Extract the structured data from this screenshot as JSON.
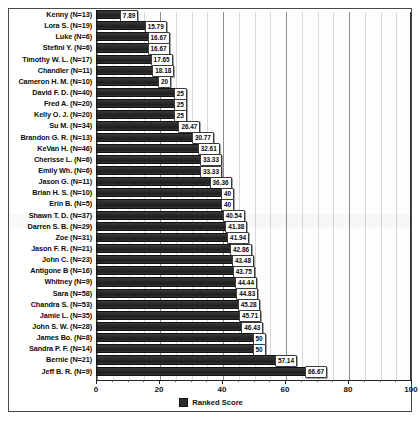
{
  "chart_data": {
    "type": "bar",
    "orientation": "horizontal",
    "title": "",
    "xlabel": "",
    "ylabel": "",
    "xlim": [
      0,
      100
    ],
    "xticks": [
      0,
      20,
      40,
      60,
      80,
      100
    ],
    "minor_tick_step": 5,
    "grid": true,
    "legend_position": "bottom",
    "legend": [
      "Ranked Score"
    ],
    "series_name": "Ranked Score",
    "bar_color": "#2b2b2b",
    "categories": [
      "Kenny (N=13)",
      "Lora S. (N=19)",
      "Luke (N=6)",
      "Stefini Y. (N=6)",
      "Timothy W. L. (N=17)",
      "Chandler (N=11)",
      "Cameron H. M. (N=10)",
      "David F. D. (N=40)",
      "Fred A. (N=20)",
      "Kelly O. J. (N=20)",
      "Su M. (N=34)",
      "Brandon G. R. (N=13)",
      "KeVan H. (N=46)",
      "Cherisse L. (N=6)",
      "Emily Wh. (N=6)",
      "Jason G. (N=11)",
      "Brian H. S. (N=10)",
      "Erin B. (N=5)",
      "Shawn T. D. (N=37)",
      "Darren S. B. (N=29)",
      "Zoe (N=31)",
      "Jason F. R. (N=21)",
      "John C. (N=23)",
      "Antigone B (N=16)",
      "Whitney (N=9)",
      "Sara (N=58)",
      "Chandra S. (N=53)",
      "Jamie L. (N=35)",
      "John S. W. (N=28)",
      "James Bo. (N=8)",
      "Sandra P. F. (N=14)",
      "Bernie (N=21)",
      "Jeff B. R. (N=9)"
    ],
    "values": [
      7.89,
      15.79,
      16.67,
      16.67,
      17.65,
      18.18,
      20,
      25,
      25,
      25,
      26.47,
      30.77,
      32.61,
      33.33,
      33.33,
      36.36,
      40,
      40,
      40.54,
      41.38,
      41.94,
      42.86,
      43.48,
      43.75,
      44.44,
      44.83,
      45.28,
      45.71,
      46.43,
      50,
      50,
      57.14,
      66.67
    ],
    "value_labels": [
      "7.89",
      "15.79",
      "16.67",
      "16.67",
      "17.65",
      "18.18",
      "20",
      "25",
      "25",
      "25",
      "26.47",
      "30.77",
      "32.61",
      "33.33",
      "33.33",
      "36.36",
      "40",
      "40",
      "40.54",
      "41.38",
      "41.94",
      "42.86",
      "43.48",
      "43.75",
      "44.44",
      "44.83",
      "45.28",
      "45.71",
      "46.43",
      "50",
      "50",
      "57.14",
      "66.67"
    ]
  },
  "footnote": ""
}
